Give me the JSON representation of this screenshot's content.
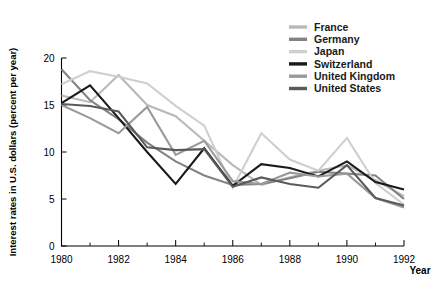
{
  "chart_data": {
    "type": "line",
    "title": "",
    "xlabel": "Year",
    "ylabel": "Interest rates in U.S. dollars (percent per year)",
    "x": [
      1980,
      1981,
      1982,
      1983,
      1984,
      1985,
      1986,
      1987,
      1988,
      1989,
      1990,
      1991,
      1992
    ],
    "xlim": [
      1980,
      1992
    ],
    "ylim": [
      0,
      20
    ],
    "yticks": [
      0,
      5,
      10,
      15,
      20
    ],
    "xticks": [
      1980,
      1982,
      1984,
      1986,
      1988,
      1990,
      1992
    ],
    "xticks_minor": [
      1981,
      1983,
      1985,
      1987,
      1989,
      1991
    ],
    "grid": false,
    "legend_position": "top-right",
    "series": [
      {
        "name": "France",
        "color": "#b9b9b9",
        "values": [
          16.0,
          15.3,
          18.2,
          15.0,
          13.8,
          11.2,
          8.6,
          6.5,
          7.3,
          8.0,
          8.6,
          7.0,
          5.3
        ]
      },
      {
        "name": "Germany",
        "color": "#838383",
        "values": [
          18.8,
          15.5,
          13.5,
          11.0,
          9.0,
          7.5,
          6.5,
          6.6,
          7.2,
          7.9,
          7.7,
          7.5,
          5.0
        ]
      },
      {
        "name": "Japan",
        "color": "#cfcfcf",
        "values": [
          17.2,
          18.6,
          18.0,
          17.3,
          14.9,
          12.8,
          6.2,
          12.0,
          9.2,
          8.0,
          11.5,
          6.7,
          4.4
        ]
      },
      {
        "name": "Switzerland",
        "color": "#1a1a1a",
        "values": [
          15.2,
          17.1,
          13.6,
          10.0,
          6.6,
          10.4,
          6.4,
          8.7,
          8.3,
          7.4,
          9.0,
          6.8,
          6.0
        ]
      },
      {
        "name": "United Kingdom",
        "color": "#9a9a9a",
        "values": [
          15.0,
          13.6,
          12.0,
          14.8,
          9.7,
          11.2,
          6.9,
          6.6,
          7.8,
          7.4,
          7.7,
          5.1,
          4.1
        ]
      },
      {
        "name": "United States",
        "color": "#5a5a5a",
        "values": [
          15.1,
          14.9,
          14.3,
          10.5,
          10.2,
          10.3,
          6.3,
          7.3,
          6.6,
          6.2,
          8.6,
          5.1,
          4.3
        ]
      }
    ]
  },
  "legend": {
    "entries": [
      {
        "label": "France"
      },
      {
        "label": "Germany"
      },
      {
        "label": "Japan"
      },
      {
        "label": "Switzerland"
      },
      {
        "label": "United Kingdom"
      },
      {
        "label": "United States"
      }
    ]
  },
  "axes": {
    "y_title": "Interest rates in U.S. dollars (percent per year)",
    "x_title": "Year",
    "y_tick_labels": [
      "0",
      "5",
      "10",
      "15",
      "20"
    ],
    "x_tick_labels": [
      "1980",
      "1982",
      "1984",
      "1986",
      "1988",
      "1990",
      "1992"
    ]
  }
}
